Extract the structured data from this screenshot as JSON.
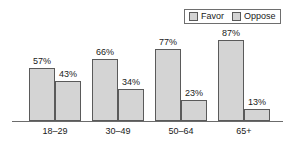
{
  "legend": {
    "entries": [
      {
        "label": "Favor",
        "swatch": "legend-swatch-favor"
      },
      {
        "label": "Oppose",
        "swatch": "legend-swatch-oppose"
      }
    ]
  },
  "chart_data": {
    "type": "bar",
    "title": "",
    "subtitle": "",
    "xlabel": "",
    "ylabel": "",
    "ylim": [
      0,
      100
    ],
    "grid": false,
    "legend_position": "top-right",
    "categories": [
      "18–29",
      "30–49",
      "50–64",
      "65+"
    ],
    "series": [
      {
        "name": "Favor",
        "values": [
          57,
          66,
          77,
          87
        ],
        "labels": [
          "57%",
          "66%",
          "77%",
          "87%"
        ]
      },
      {
        "name": "Oppose",
        "values": [
          43,
          34,
          23,
          13
        ],
        "labels": [
          "43%",
          "34%",
          "23%",
          "13%"
        ]
      }
    ],
    "value_suffix": "%",
    "colors": {
      "bar_fill": "#d4d4d4",
      "bar_border": "#5a5a5a",
      "axis": "#6b6b6b",
      "text": "#1a1a1a",
      "background": "#ffffff"
    }
  }
}
